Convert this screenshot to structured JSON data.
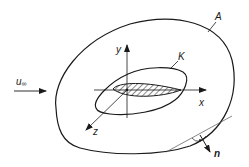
{
  "diagram": {
    "labels": {
      "freestream": "u",
      "freestream_sub": "∞",
      "surface": "A",
      "contour": "K",
      "x_axis": "x",
      "y_axis": "y",
      "z_axis": "z",
      "normal": "n"
    },
    "colors": {
      "line": "#1a1a1a",
      "thin_line": "#555555",
      "background": "#ffffff"
    }
  }
}
